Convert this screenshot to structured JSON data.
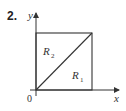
{
  "problem": {
    "number": "2."
  },
  "axes": {
    "x_label": "x",
    "y_label": "y",
    "origin_label": "0"
  },
  "regions": [
    {
      "name": "R",
      "subscript": "2"
    },
    {
      "name": "R",
      "subscript": "1"
    }
  ],
  "colors": {
    "line": "#333333",
    "background": "#ffffff"
  }
}
